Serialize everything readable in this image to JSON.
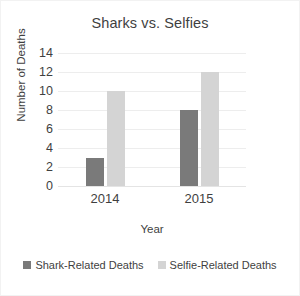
{
  "chart_data": {
    "type": "bar",
    "title": "Sharks vs. Selfies",
    "xlabel": "Year",
    "ylabel": "Number of Deaths",
    "categories": [
      "2014",
      "2015"
    ],
    "series": [
      {
        "name": "Shark-Related Deaths",
        "values": [
          3,
          8
        ],
        "color": "#7a7a7a"
      },
      {
        "name": "Selfie-Related Deaths",
        "values": [
          10,
          12
        ],
        "color": "#d4d4d4"
      }
    ],
    "ylim": [
      0,
      14
    ],
    "yticks": [
      14,
      12,
      10,
      8,
      6,
      4,
      2,
      0
    ],
    "grid": "horizontal",
    "legend_position": "bottom"
  }
}
